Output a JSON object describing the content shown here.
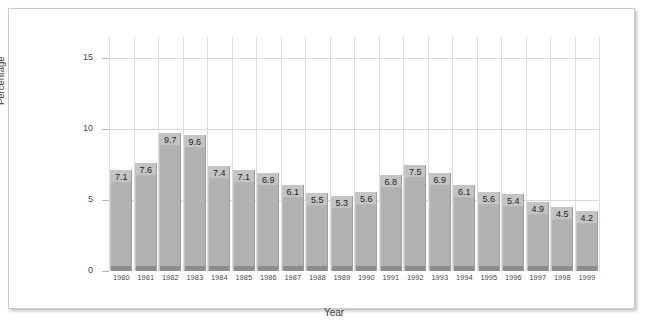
{
  "chart_data": {
    "type": "bar",
    "title": "",
    "xlabel": "Year",
    "ylabel": "Percentage",
    "categories": [
      "1980",
      "1981",
      "1982",
      "1983",
      "1984",
      "1985",
      "1986",
      "1987",
      "1988",
      "1989",
      "1990",
      "1991",
      "1992",
      "1993",
      "1994",
      "1995",
      "1996",
      "1997",
      "1998",
      "1999"
    ],
    "values": [
      7.1,
      7.6,
      9.7,
      9.6,
      7.4,
      7.1,
      6.9,
      6.1,
      5.5,
      5.3,
      5.6,
      6.8,
      7.5,
      6.9,
      6.1,
      5.6,
      5.4,
      4.9,
      4.5,
      4.2
    ],
    "value_labels": [
      "7.1",
      "7.6",
      "9.7",
      "9.6",
      "7.4",
      "7.1",
      "6.9",
      "6.1",
      "5.5",
      "5.3",
      "5.6",
      "6.8",
      "7.5",
      "6.9",
      "6.1",
      "5.6",
      "5.4",
      "4.9",
      "4.5",
      "4.2"
    ],
    "ylim": [
      0,
      16.5
    ],
    "yticks": [
      0,
      5,
      10,
      15
    ],
    "ytick_labels": [
      "0",
      "5",
      "10",
      "15"
    ],
    "grid": true,
    "legend": null,
    "bar_color": "#b2b2b2",
    "bar_cap_color": "#c4c4c4",
    "bar_base_color": "#8d8d8d",
    "grid_color": "#d8d8d8",
    "text_color": "#3d3d3d",
    "background": "#ffffff"
  }
}
